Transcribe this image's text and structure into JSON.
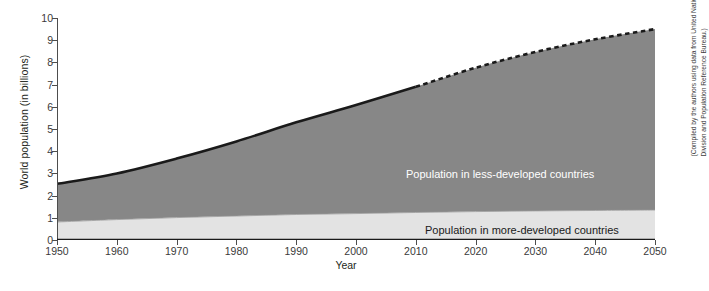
{
  "chart_data": {
    "type": "area",
    "title": "",
    "xlabel": "Year",
    "ylabel": "World population (in billions)",
    "xlim": [
      1950,
      2050
    ],
    "ylim": [
      0,
      10
    ],
    "grid": false,
    "legend_position": "inline-annotation",
    "stacked": true,
    "projection_start_year": 2010,
    "projection_style": "dashed top edge",
    "x": [
      1950,
      1960,
      1970,
      1980,
      1990,
      2000,
      2010,
      2020,
      2030,
      2040,
      2050
    ],
    "xticks": [
      "1950",
      "1960",
      "1970",
      "1980",
      "1990",
      "2000",
      "2010",
      "2020",
      "2030",
      "2040",
      "2050"
    ],
    "yticks": [
      "0",
      "1",
      "2",
      "3",
      "4",
      "5",
      "6",
      "7",
      "8",
      "9",
      "10"
    ],
    "series": [
      {
        "name": "Population in more-developed countries",
        "color": "#e3e3e3",
        "values": [
          0.81,
          0.92,
          1.01,
          1.08,
          1.15,
          1.19,
          1.24,
          1.28,
          1.31,
          1.33,
          1.35
        ]
      },
      {
        "name": "Population in less-developed countries",
        "color": "#878787",
        "values": [
          1.72,
          2.08,
          2.66,
          3.36,
          4.15,
          4.89,
          5.66,
          6.48,
          7.16,
          7.71,
          8.15
        ]
      }
    ],
    "totals": [
      2.53,
      3.0,
      3.67,
      4.44,
      5.3,
      6.08,
      6.9,
      7.76,
      8.47,
      9.04,
      9.5
    ],
    "annotations": [
      {
        "text": "Population in less-developed countries",
        "x": 2012,
        "y": 3.2
      },
      {
        "text": "Population in more-developed countries",
        "x": 2015,
        "y": 0.7
      }
    ]
  },
  "labels": {
    "y_axis_title": "World population (in billions)",
    "x_axis_title": "Year",
    "less_developed": "Population in less-developed countries",
    "more_developed": "Population in more-developed countries"
  },
  "credit": {
    "text": "(Compiled by the authors using data from United Nations Population Division and Population Reference Bureau.)"
  },
  "colors": {
    "less_developed_fill": "#878787",
    "more_developed_fill": "#e3e3e3",
    "outline": "#1a1a1a",
    "axis": "#4d4d4d",
    "background": "#ffffff"
  }
}
